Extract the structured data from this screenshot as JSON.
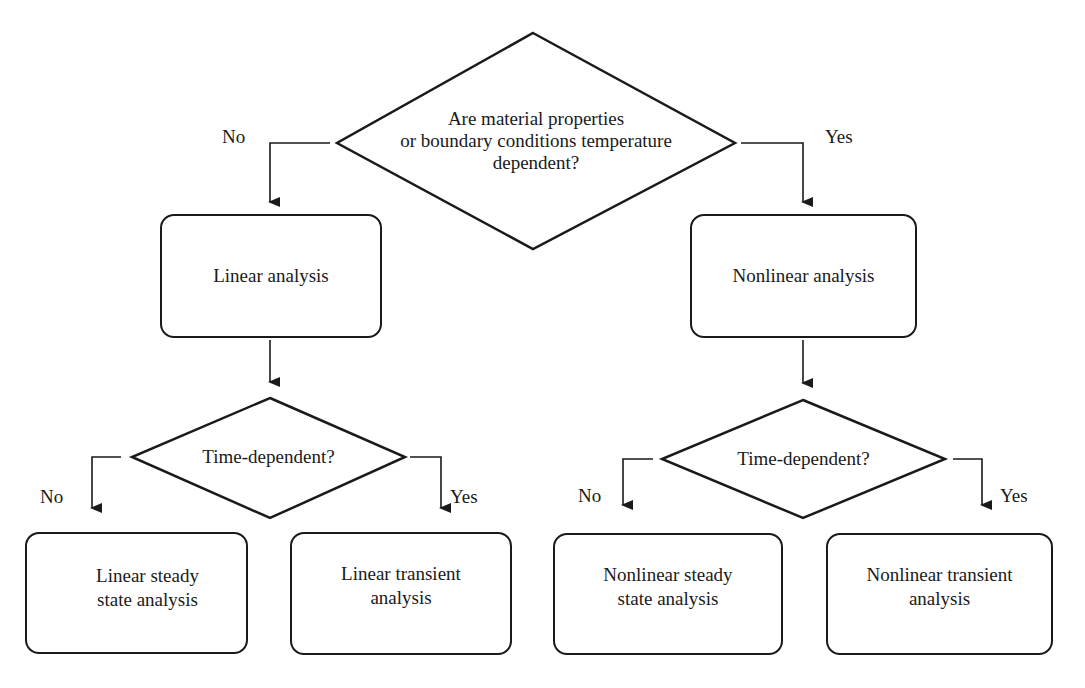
{
  "diagram": {
    "type": "flowchart",
    "root_decision": {
      "lines": [
        "Are material properties",
        "or boundary conditions temperature",
        "dependent?"
      ],
      "no_label": "No",
      "yes_label": "Yes"
    },
    "left_process": {
      "label": "Linear analysis"
    },
    "right_process": {
      "label": "Nonlinear analysis"
    },
    "left_decision": {
      "label": "Time-dependent?",
      "no_label": "No",
      "yes_label": "Yes"
    },
    "right_decision": {
      "label": "Time-dependent?",
      "no_label": "No",
      "yes_label": "Yes"
    },
    "outcomes": [
      {
        "lines": [
          "Linear steady",
          "state analysis"
        ]
      },
      {
        "lines": [
          "Linear transient",
          "analysis"
        ]
      },
      {
        "lines": [
          "Nonlinear steady",
          "state analysis"
        ]
      },
      {
        "lines": [
          "Nonlinear transient",
          "analysis"
        ]
      }
    ],
    "stroke_color": "#1a1a1a",
    "background_color": "#ffffff"
  }
}
